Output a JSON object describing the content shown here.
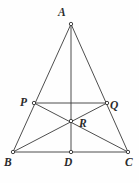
{
  "figure": {
    "background_color": "#fefefe",
    "line_color": "#3a3a3a",
    "label_color": "#2b2b2b",
    "width": 139,
    "height": 183
  },
  "points": [
    {
      "id": "A",
      "label": "A",
      "x": 71,
      "y": 24,
      "role": "apex-vertex"
    },
    {
      "id": "P",
      "label": "P",
      "x": 34,
      "y": 103,
      "role": "side-point-ab"
    },
    {
      "id": "Q",
      "label": "Q",
      "x": 107,
      "y": 103,
      "role": "side-point-ac"
    },
    {
      "id": "R",
      "label": "R",
      "x": 71,
      "y": 121,
      "role": "intersection-point"
    },
    {
      "id": "B",
      "label": "B",
      "x": 13,
      "y": 152,
      "role": "base-vertex-left"
    },
    {
      "id": "D",
      "label": "D",
      "x": 71,
      "y": 152,
      "role": "base-midpoint"
    },
    {
      "id": "C",
      "label": "C",
      "x": 128,
      "y": 152,
      "role": "base-vertex-right"
    }
  ],
  "segments": [
    {
      "name": "side-ab",
      "from": "A",
      "to": "B"
    },
    {
      "name": "side-ac",
      "from": "A",
      "to": "C"
    },
    {
      "name": "side-bc",
      "from": "B",
      "to": "C"
    },
    {
      "name": "median-ad",
      "from": "A",
      "to": "D"
    },
    {
      "name": "cevian-bq",
      "from": "B",
      "to": "Q"
    },
    {
      "name": "cevian-cp",
      "from": "C",
      "to": "P"
    },
    {
      "name": "midsegment-pq",
      "from": "P",
      "to": "Q"
    }
  ]
}
